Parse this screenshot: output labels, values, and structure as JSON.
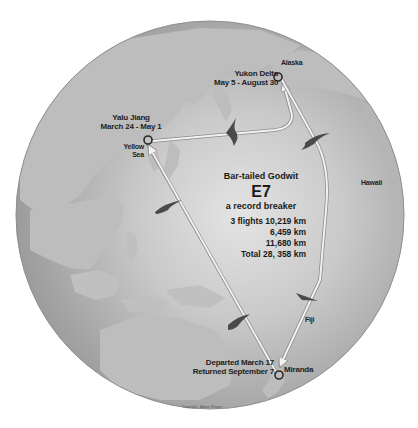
{
  "map": {
    "title": "Bar-tailed Godwit",
    "bird_id": "E7",
    "subtitle": "a record breaker",
    "flights": [
      {
        "label": "3 flights",
        "distance": "10,219 km"
      },
      {
        "label": "",
        "distance": "6,459 km"
      },
      {
        "label": "",
        "distance": "11,680 km"
      }
    ],
    "total_label": "Total",
    "total_distance": "28, 358 km",
    "flights_line1": "3 flights 10,219 km",
    "flights_line2": "6,459 km",
    "flights_line3": "11,680 km",
    "flights_total": "Total  28, 358 km",
    "locations": {
      "alaska": "Alaska",
      "yukon_delta": {
        "name": "Yukon Delta",
        "dates": "May 5 - August 30"
      },
      "yalu_jiang": {
        "name": "Yalu Jiang",
        "dates": "March 24 - May 1"
      },
      "yellow_sea": {
        "line1": "Yellow",
        "line2": "Sea"
      },
      "hawaii": "Hawaii",
      "fiji": "Fiji",
      "miranda": {
        "name": "Miranda",
        "departed": "Departed March 17",
        "returned": "Returned September 7"
      }
    },
    "copyright": "Copyright - Adrian Riegen",
    "colors": {
      "background": "#ffffff",
      "ocean": "#a9a9a9",
      "ocean_light": "#dcdcdc",
      "land": "#c4c4c4",
      "route": "#f2f2f2",
      "route_outline": "#8a8a8a",
      "bird": "#4a4a4a",
      "marker": "#2a2a2a",
      "text": "#1e1e1e"
    }
  }
}
